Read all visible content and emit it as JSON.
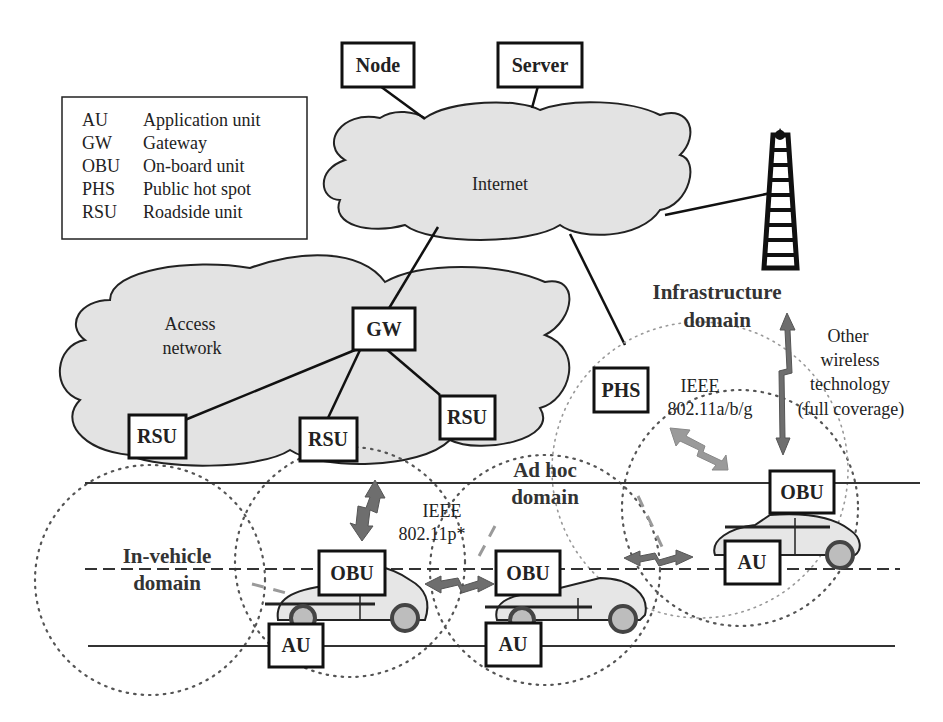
{
  "legend": {
    "items": [
      {
        "abbr": "AU",
        "desc": "Application unit"
      },
      {
        "abbr": "GW",
        "desc": "Gateway"
      },
      {
        "abbr": "OBU",
        "desc": "On-board unit"
      },
      {
        "abbr": "PHS",
        "desc": "Public hot spot"
      },
      {
        "abbr": "RSU",
        "desc": "Roadside unit"
      }
    ]
  },
  "nodes": {
    "node": "Node",
    "server": "Server",
    "gw": "GW",
    "phs": "PHS",
    "rsu_left": "RSU",
    "rsu_middle": "RSU",
    "rsu_right": "RSU",
    "obu_left": "OBU",
    "obu_middle": "OBU",
    "obu_right": "OBU",
    "au_left": "AU",
    "au_middle": "AU",
    "au_right": "AU"
  },
  "clouds": {
    "internet": "Internet",
    "access_line1": "Access",
    "access_line2": "network"
  },
  "domains": {
    "infrastructure_line1": "Infrastructure",
    "infrastructure_line2": "domain",
    "adhoc_line1": "Ad hoc",
    "adhoc_line2": "domain",
    "invehicle_line1": "In-vehicle",
    "invehicle_line2": "domain"
  },
  "technologies": {
    "wifi_line1": "IEEE",
    "wifi_line2": "802.11a/b/g",
    "dsrc_line1": "IEEE",
    "dsrc_line2": "802.11p*",
    "other_line1": "Other",
    "other_line2": "wireless",
    "other_line3": "technology",
    "other_line4": "(full coverage)"
  }
}
